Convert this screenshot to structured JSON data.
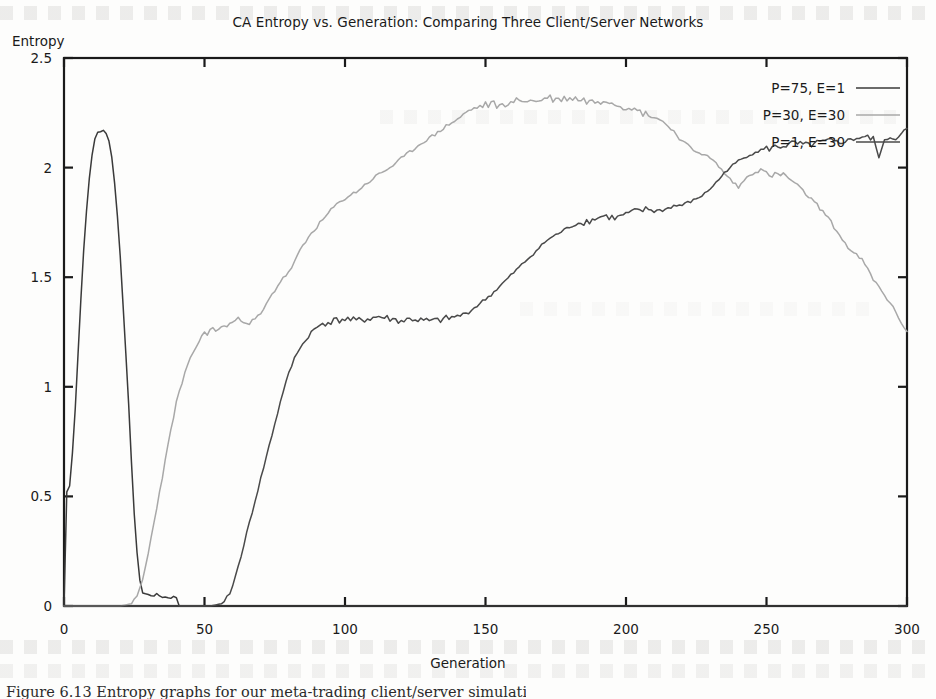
{
  "figure": {
    "title": "CA Entropy vs. Generation: Comparing Three Client/Server Networks",
    "y_axis_label": "Entropy",
    "x_axis_label": "Generation",
    "caption": "Figure 6.13 Entropy graphs for our meta-trading client/server simulations."
  },
  "colors": {
    "series_p75_e1": "#3a3a3a",
    "series_p30_e30": "#a8a8a8",
    "series_p1_e30": "#4a4a4a",
    "axis": "#1a1a1a",
    "background": "#fdfdfc"
  },
  "chart_data": {
    "type": "line",
    "title": "CA Entropy vs. Generation: Comparing Three Client/Server Networks",
    "xlabel": "Generation",
    "ylabel": "Entropy",
    "xlim": [
      0,
      300
    ],
    "ylim": [
      0,
      2.5
    ],
    "xticks": [
      0,
      50,
      100,
      150,
      200,
      250,
      300
    ],
    "xtick_labels": [
      "0",
      "50",
      "100",
      "150",
      "200",
      "250",
      "300"
    ],
    "yticks": [
      0,
      0.5,
      1,
      1.5,
      2,
      2.5
    ],
    "ytick_labels": [
      "0",
      "0.5",
      "1",
      "1.5",
      "2",
      "2.5"
    ],
    "grid": false,
    "legend_position": "top-right",
    "series": [
      {
        "name": "P=75, E=1",
        "color": "#3a3a3a",
        "x": [
          0,
          1,
          2,
          3,
          4,
          5,
          6,
          7,
          8,
          9,
          10,
          11,
          12,
          13,
          14,
          15,
          16,
          17,
          18,
          19,
          20,
          21,
          22,
          23,
          24,
          25,
          26,
          27,
          28,
          30,
          33,
          36,
          38,
          40,
          41,
          43,
          50,
          60,
          80,
          120,
          180,
          240,
          300
        ],
        "y": [
          0.0,
          0.52,
          0.55,
          0.7,
          0.9,
          1.15,
          1.4,
          1.62,
          1.8,
          1.95,
          2.06,
          2.13,
          2.16,
          2.17,
          2.17,
          2.16,
          2.12,
          2.05,
          1.93,
          1.78,
          1.6,
          1.38,
          1.15,
          0.92,
          0.66,
          0.42,
          0.24,
          0.12,
          0.06,
          0.05,
          0.05,
          0.04,
          0.04,
          0.04,
          0.0,
          0.0,
          0.0,
          0.0,
          0.0,
          0.0,
          0.0,
          0.0,
          0.0
        ]
      },
      {
        "name": "P=30, E=30",
        "color": "#a8a8a8",
        "x": [
          0,
          20,
          24,
          26,
          28,
          30,
          32,
          34,
          36,
          38,
          40,
          43,
          46,
          50,
          54,
          58,
          62,
          66,
          70,
          74,
          78,
          80,
          82,
          84,
          86,
          88,
          92,
          96,
          100,
          104,
          108,
          112,
          116,
          120,
          124,
          128,
          132,
          136,
          140,
          144,
          148,
          152,
          156,
          160,
          164,
          168,
          172,
          176,
          180,
          184,
          188,
          192,
          196,
          200,
          204,
          208,
          212,
          216,
          220,
          224,
          228,
          232,
          236,
          240,
          244,
          248,
          252,
          256,
          260,
          264,
          268,
          272,
          276,
          280,
          284,
          288,
          292,
          296,
          300
        ],
        "y": [
          0.0,
          0.0,
          0.01,
          0.04,
          0.12,
          0.24,
          0.38,
          0.52,
          0.66,
          0.8,
          0.93,
          1.06,
          1.16,
          1.25,
          1.26,
          1.28,
          1.31,
          1.29,
          1.33,
          1.42,
          1.5,
          1.52,
          1.57,
          1.62,
          1.66,
          1.7,
          1.76,
          1.82,
          1.86,
          1.89,
          1.93,
          1.97,
          2.0,
          2.04,
          2.08,
          2.12,
          2.15,
          2.19,
          2.22,
          2.26,
          2.28,
          2.29,
          2.28,
          2.3,
          2.31,
          2.3,
          2.32,
          2.31,
          2.32,
          2.31,
          2.3,
          2.31,
          2.29,
          2.28,
          2.26,
          2.24,
          2.22,
          2.18,
          2.12,
          2.08,
          2.06,
          2.02,
          1.96,
          1.91,
          1.97,
          1.99,
          1.96,
          1.97,
          1.93,
          1.88,
          1.83,
          1.77,
          1.69,
          1.62,
          1.58,
          1.49,
          1.42,
          1.34,
          1.25
        ]
      },
      {
        "name": "P=1, E=30",
        "color": "#4a4a4a",
        "x": [
          0,
          40,
          52,
          56,
          58,
          60,
          62,
          64,
          66,
          68,
          70,
          72,
          74,
          76,
          78,
          80,
          82,
          84,
          86,
          88,
          90,
          92,
          96,
          100,
          104,
          108,
          112,
          116,
          120,
          124,
          128,
          132,
          136,
          140,
          144,
          148,
          152,
          156,
          160,
          164,
          168,
          172,
          176,
          180,
          184,
          188,
          192,
          196,
          200,
          204,
          208,
          212,
          216,
          220,
          224,
          228,
          232,
          236,
          240,
          244,
          248,
          252,
          256,
          260,
          264,
          268,
          272,
          276,
          280,
          284,
          288,
          290,
          292,
          294,
          296,
          298,
          300
        ],
        "y": [
          0.0,
          0.0,
          0.0,
          0.01,
          0.03,
          0.09,
          0.18,
          0.28,
          0.38,
          0.48,
          0.58,
          0.68,
          0.78,
          0.88,
          0.98,
          1.06,
          1.13,
          1.18,
          1.21,
          1.25,
          1.27,
          1.29,
          1.3,
          1.31,
          1.3,
          1.31,
          1.32,
          1.31,
          1.3,
          1.31,
          1.3,
          1.3,
          1.31,
          1.32,
          1.34,
          1.38,
          1.42,
          1.47,
          1.52,
          1.57,
          1.62,
          1.67,
          1.7,
          1.73,
          1.75,
          1.76,
          1.78,
          1.77,
          1.79,
          1.8,
          1.81,
          1.8,
          1.82,
          1.83,
          1.85,
          1.88,
          1.93,
          1.99,
          2.03,
          2.06,
          2.08,
          2.09,
          2.1,
          2.11,
          2.1,
          2.11,
          2.12,
          2.11,
          2.13,
          2.14,
          2.13,
          2.05,
          2.12,
          2.14,
          2.13,
          2.16,
          2.17
        ]
      }
    ]
  }
}
